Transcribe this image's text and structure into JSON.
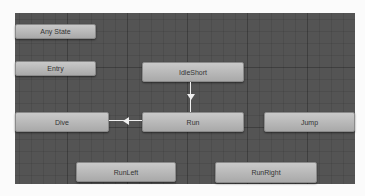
{
  "animator": {
    "states": [
      {
        "id": "any-state",
        "label": "Any State"
      },
      {
        "id": "entry",
        "label": "Entry"
      },
      {
        "id": "idle-short",
        "label": "IdleShort"
      },
      {
        "id": "run",
        "label": "Run"
      },
      {
        "id": "dive",
        "label": "Dive"
      },
      {
        "id": "jump",
        "label": "Jump"
      },
      {
        "id": "run-left",
        "label": "RunLeft"
      },
      {
        "id": "run-right",
        "label": "RunRight"
      }
    ],
    "transitions": [
      {
        "from": "IdleShort",
        "to": "Run"
      },
      {
        "from": "Run",
        "to": "Dive"
      }
    ]
  }
}
